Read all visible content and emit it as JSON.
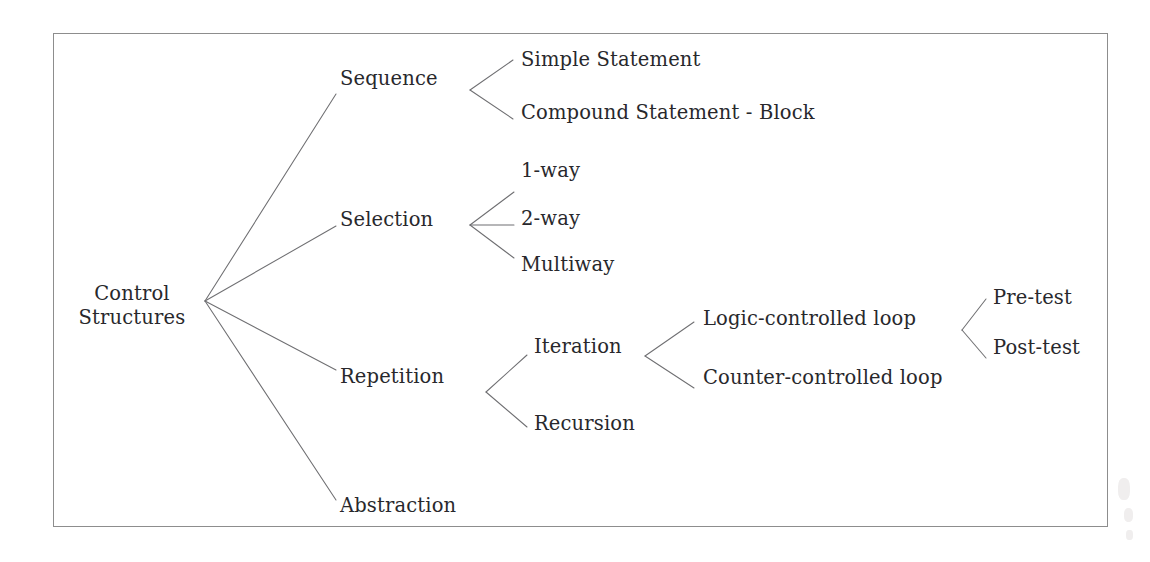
{
  "diagram": {
    "title": "Control Structures",
    "type": "tree",
    "frame": {
      "border_color": "#8d8d8d"
    },
    "text_color": "#28282c",
    "edge_color": "#6f6f72",
    "nodes": {
      "root": "Control\nStructures",
      "sequence": "Sequence",
      "selection": "Selection",
      "repetition": "Repetition",
      "abstraction": "Abstraction",
      "simple_statement": "Simple Statement",
      "compound_statement": "Compound Statement - Block",
      "one_way": "1-way",
      "two_way": "2-way",
      "multiway": "Multiway",
      "iteration": "Iteration",
      "recursion": "Recursion",
      "logic_controlled_loop": "Logic-controlled loop",
      "counter_controlled_loop": "Counter-controlled loop",
      "pre_test": "Pre-test",
      "post_test": "Post-test"
    },
    "hierarchy": [
      {
        "label": "Control Structures",
        "children": [
          {
            "label": "Sequence",
            "children": [
              {
                "label": "Simple Statement",
                "children": []
              },
              {
                "label": "Compound Statement - Block",
                "children": []
              }
            ]
          },
          {
            "label": "Selection",
            "children": [
              {
                "label": "1-way",
                "children": []
              },
              {
                "label": "2-way",
                "children": []
              },
              {
                "label": "Multiway",
                "children": []
              }
            ]
          },
          {
            "label": "Repetition",
            "children": [
              {
                "label": "Iteration",
                "children": [
                  {
                    "label": "Logic-controlled loop",
                    "children": [
                      {
                        "label": "Pre-test",
                        "children": []
                      },
                      {
                        "label": "Post-test",
                        "children": []
                      }
                    ]
                  },
                  {
                    "label": "Counter-controlled loop",
                    "children": []
                  }
                ]
              },
              {
                "label": "Recursion",
                "children": []
              }
            ]
          },
          {
            "label": "Abstraction",
            "children": []
          }
        ]
      }
    ]
  }
}
